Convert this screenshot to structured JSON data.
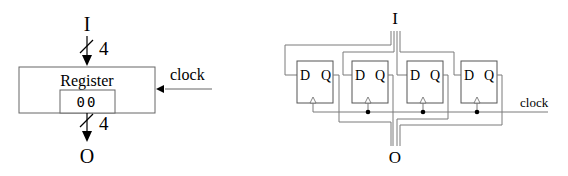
{
  "left_diagram": {
    "input_label": "I",
    "output_label": "O",
    "input_bus_width": "4",
    "output_bus_width": "4",
    "block_title": "Register",
    "register_value": "00",
    "clock_label": "clock"
  },
  "right_diagram": {
    "input_label": "I",
    "output_label": "O",
    "clock_label": "clock",
    "flip_flops": [
      {
        "d_label": "D",
        "q_label": "Q"
      },
      {
        "d_label": "D",
        "q_label": "Q"
      },
      {
        "d_label": "D",
        "q_label": "Q"
      },
      {
        "d_label": "D",
        "q_label": "Q"
      }
    ]
  }
}
